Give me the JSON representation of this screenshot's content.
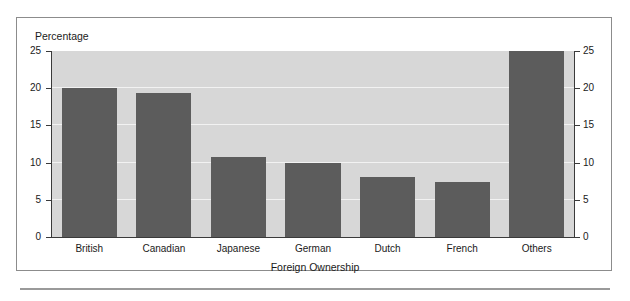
{
  "figure": {
    "y_axis_title": "Percentage",
    "x_axis_title": "Foreign Ownership"
  },
  "chart_data": {
    "type": "bar",
    "title": "",
    "xlabel": "Foreign Ownership",
    "ylabel": "Percentage",
    "categories": [
      "British",
      "Canadian",
      "Japanese",
      "German",
      "Dutch",
      "French",
      "Others"
    ],
    "values": [
      20.0,
      19.4,
      10.8,
      10.0,
      8.1,
      7.4,
      25.0
    ],
    "ylim": [
      0,
      25
    ],
    "yticks": [
      0,
      5,
      10,
      15,
      20,
      25
    ],
    "ytick_labels_left": [
      "0",
      "5",
      "10",
      "15",
      "20",
      "25"
    ],
    "ytick_labels_right": [
      "0",
      "5",
      "10",
      "15",
      "20",
      "25"
    ],
    "grid": true,
    "grid_color": "#f2f2f2",
    "legend": null,
    "bar_color": "#5c5c5c",
    "plot_background": "#d7d7d7",
    "dual_y_axis": true
  }
}
